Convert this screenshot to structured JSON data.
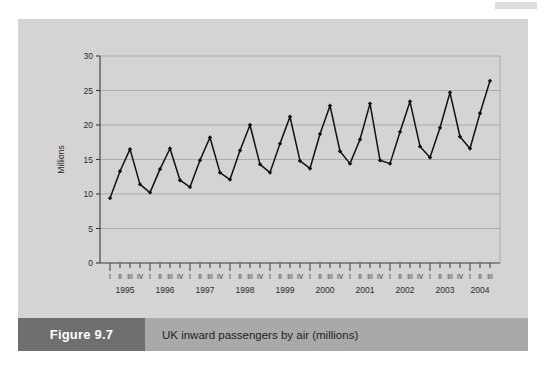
{
  "figure": {
    "number_label": "Figure 9.7",
    "caption": "UK inward passengers by air (millions)",
    "panel_bg": "#d3d4d3",
    "caption_bar_bg": "#a8a9a8",
    "number_block_bg": "#6e6f6e",
    "line_color": "#111111"
  },
  "chart_data": {
    "type": "line",
    "title": "UK inward passengers by air (millions)",
    "xlabel": "",
    "ylabel": "Millions",
    "ylim": [
      0,
      30
    ],
    "yticks": [
      0,
      5,
      10,
      15,
      20,
      25,
      30
    ],
    "ytick_labels": [
      "0",
      "5",
      "10",
      "15",
      "20",
      "25",
      "30"
    ],
    "grid": true,
    "grid_axis": "y",
    "legend": "none",
    "marker": "diamond",
    "quarter_labels": [
      "I",
      "II",
      "III",
      "IV"
    ],
    "years": [
      "1995",
      "1996",
      "1997",
      "1998",
      "1999",
      "2000",
      "2001",
      "2002",
      "2003",
      "2004"
    ],
    "x": [
      "1995 I",
      "1995 II",
      "1995 III",
      "1995 IV",
      "1996 I",
      "1996 II",
      "1996 III",
      "1996 IV",
      "1997 I",
      "1997 II",
      "1997 III",
      "1997 IV",
      "1998 I",
      "1998 II",
      "1998 III",
      "1998 IV",
      "1999 I",
      "1999 II",
      "1999 III",
      "1999 IV",
      "2000 I",
      "2000 II",
      "2000 III",
      "2000 IV",
      "2001 I",
      "2001 II",
      "2001 III",
      "2001 IV",
      "2002 I",
      "2002 II",
      "2002 III",
      "2002 IV",
      "2003 I",
      "2003 II",
      "2003 III",
      "2003 IV",
      "2004 I",
      "2004 II",
      "2004 III"
    ],
    "values": [
      9.4,
      13.3,
      16.5,
      11.4,
      10.2,
      13.6,
      16.6,
      12.0,
      11.0,
      14.9,
      18.2,
      13.1,
      12.1,
      16.3,
      20.0,
      14.3,
      13.1,
      17.3,
      21.2,
      14.8,
      13.7,
      18.7,
      22.8,
      16.2,
      14.4,
      17.9,
      23.1,
      14.9,
      14.4,
      19.0,
      23.4,
      16.9,
      15.3,
      19.6,
      24.7,
      18.3,
      16.6,
      21.7,
      26.4
    ],
    "series": [
      {
        "name": "UK inward passengers by air",
        "values": [
          9.4,
          13.3,
          16.5,
          11.4,
          10.2,
          13.6,
          16.6,
          12.0,
          11.0,
          14.9,
          18.2,
          13.1,
          12.1,
          16.3,
          20.0,
          14.3,
          13.1,
          17.3,
          21.2,
          14.8,
          13.7,
          18.7,
          22.8,
          16.2,
          14.4,
          17.9,
          23.1,
          14.9,
          14.4,
          19.0,
          23.4,
          16.9,
          15.3,
          19.6,
          24.7,
          18.3,
          16.6,
          21.7,
          26.4
        ]
      }
    ]
  }
}
